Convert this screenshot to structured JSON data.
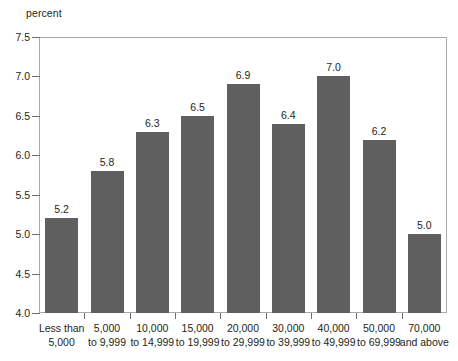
{
  "chart_data": {
    "type": "bar",
    "title": "",
    "subtitle": "",
    "xlabel": "",
    "ylabel": "percent",
    "ylim": [
      4.0,
      7.5
    ],
    "ytick_labels": [
      "7.5",
      "7.0",
      "6.5",
      "6.0",
      "5.5",
      "5.0",
      "4.5",
      "4.0"
    ],
    "ytick_values": [
      7.5,
      7.0,
      6.5,
      6.0,
      5.5,
      5.0,
      4.5,
      4.0
    ],
    "grid": false,
    "legend": "none",
    "categories": [
      "Less than 5,000",
      "5,000 to 9,999",
      "10,000 to 14,999",
      "15,000 to 19,999",
      "20,000 to 29,999",
      "30,000 to 39,999",
      "40,000 to 49,999",
      "50,000 to 69,999",
      "70,000 and above"
    ],
    "category_lines": [
      {
        "line1": "Less than",
        "line2": "5,000"
      },
      {
        "line1": "5,000",
        "line2": "to 9,999"
      },
      {
        "line1": "10,000",
        "line2": "to 14,999"
      },
      {
        "line1": "15,000",
        "line2": "to 19,999"
      },
      {
        "line1": "20,000",
        "line2": "to 29,999"
      },
      {
        "line1": "30,000",
        "line2": "to 39,999"
      },
      {
        "line1": "40,000",
        "line2": "to 49,999"
      },
      {
        "line1": "50,000",
        "line2": "to 69,999"
      },
      {
        "line1": "70,000",
        "line2": "and above"
      }
    ],
    "values": [
      5.2,
      5.8,
      6.3,
      6.5,
      6.9,
      6.4,
      7.0,
      6.2,
      5.0
    ],
    "value_labels": [
      "5.2",
      "5.8",
      "6.3",
      "6.5",
      "6.9",
      "6.4",
      "7.0",
      "6.2",
      "5.0"
    ],
    "bar_color": "#5f5f5f",
    "frame_color": "#a9a9a9",
    "text_color": "#231f20",
    "background": "#ffffff"
  }
}
